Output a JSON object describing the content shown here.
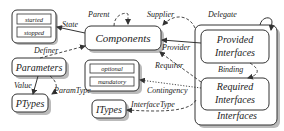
{
  "nodes": {
    "state_box": {
      "items": [
        "started",
        "stopped"
      ]
    },
    "components": {
      "label": "Components"
    },
    "parameters": {
      "label": "Parameters"
    },
    "ptypes": {
      "label": "PTypes"
    },
    "optional_box": {
      "items": [
        "optional",
        "mandatory"
      ]
    },
    "itypes": {
      "label": "ITypes"
    },
    "provided": {
      "line1": "Provided",
      "line2": "Interfaces"
    },
    "required": {
      "line1": "Required",
      "line2": "Interfaces"
    },
    "interfaces": {
      "label": "Interfaces"
    }
  },
  "edges": {
    "state": "State",
    "parent": "Parent",
    "supplier": "Supplier",
    "delegate": "Delegate",
    "provider": "Provider",
    "definer": "Definer",
    "requirer": "Requirer",
    "binding": "Binding",
    "contingency": "Contingency",
    "value": "Value",
    "param_type": "ParamType",
    "interface_type": "InterfaceType"
  }
}
